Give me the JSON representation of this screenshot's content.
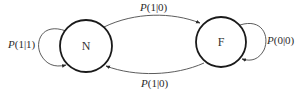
{
  "diagram": {
    "type": "state-transition",
    "nodes": [
      {
        "id": "N",
        "label": "N"
      },
      {
        "id": "F",
        "label": "F"
      }
    ],
    "edges": [
      {
        "from": "N",
        "to": "N",
        "prefix": "P",
        "args": "(1|1)"
      },
      {
        "from": "N",
        "to": "F",
        "prefix": "P",
        "args": "(1|0)"
      },
      {
        "from": "F",
        "to": "N",
        "prefix": "P",
        "args": "(1|0)"
      },
      {
        "from": "F",
        "to": "F",
        "prefix": "P",
        "args": "(0|0)"
      }
    ]
  },
  "colors": {
    "node_stroke": "#1a1a1a",
    "edge_stroke": "#4a4a4a",
    "text": "#2a2a2a"
  }
}
